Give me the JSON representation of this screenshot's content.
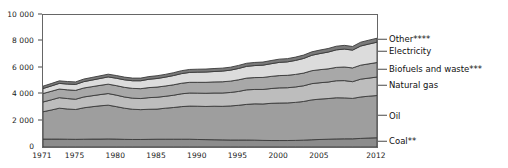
{
  "chart_data": {
    "type": "area",
    "title": "",
    "subtitle": "",
    "xlabel": "",
    "ylabel": "",
    "stacked": true,
    "grid": false,
    "legend_position": "right-inline-labels",
    "xlim": [
      1971,
      2012
    ],
    "ylim": [
      0,
      10000
    ],
    "y_ticks": [
      "0",
      "2 000",
      "4 000",
      "6 000",
      "8 000",
      "10 000"
    ],
    "y_tick_values": [
      0,
      2000,
      4000,
      6000,
      8000,
      10000
    ],
    "x_ticks": [
      "1971",
      "1975",
      "1980",
      "1985",
      "1990",
      "1995",
      "2000",
      "2005",
      "2012"
    ],
    "x_tick_values": [
      1971,
      1975,
      1980,
      1985,
      1990,
      1995,
      2000,
      2005,
      2012
    ],
    "x": [
      1971,
      1972,
      1973,
      1974,
      1975,
      1976,
      1977,
      1978,
      1979,
      1980,
      1981,
      1982,
      1983,
      1984,
      1985,
      1986,
      1987,
      1988,
      1989,
      1990,
      1991,
      1992,
      1993,
      1994,
      1995,
      1996,
      1997,
      1998,
      1999,
      2000,
      2001,
      2002,
      2003,
      2004,
      2005,
      2006,
      2007,
      2008,
      2009,
      2010,
      2011,
      2012
    ],
    "series": [
      {
        "name": "Coal**",
        "color": "#8c8c8c",
        "values": [
          600,
          600,
          600,
          590,
          580,
          590,
          600,
          600,
          610,
          600,
          580,
          570,
          570,
          580,
          590,
          590,
          590,
          590,
          590,
          570,
          560,
          550,
          540,
          530,
          530,
          530,
          520,
          500,
          490,
          490,
          490,
          500,
          520,
          550,
          570,
          590,
          610,
          620,
          620,
          650,
          680,
          700
        ]
      },
      {
        "name": "Oil",
        "color": "#9e9e9e",
        "values": [
          2070,
          2200,
          2340,
          2290,
          2260,
          2380,
          2450,
          2520,
          2560,
          2460,
          2360,
          2290,
          2260,
          2280,
          2280,
          2350,
          2400,
          2470,
          2510,
          2520,
          2510,
          2540,
          2540,
          2580,
          2630,
          2700,
          2750,
          2760,
          2820,
          2840,
          2850,
          2880,
          2930,
          3020,
          3060,
          3080,
          3120,
          3100,
          3060,
          3140,
          3170,
          3200
        ]
      },
      {
        "name": "Natural gas",
        "color": "#bdbdbd",
        "values": [
          740,
          770,
          800,
          790,
          780,
          820,
          830,
          850,
          880,
          870,
          850,
          840,
          840,
          880,
          900,
          900,
          930,
          970,
          990,
          990,
          1000,
          1000,
          1010,
          1020,
          1050,
          1100,
          1090,
          1100,
          1120,
          1150,
          1150,
          1170,
          1190,
          1230,
          1240,
          1250,
          1290,
          1310,
          1270,
          1350,
          1370,
          1400
        ]
      },
      {
        "name": "Biofuels and waste***",
        "color": "#a8a8a8",
        "values": [
          640,
          650,
          650,
          660,
          670,
          680,
          690,
          700,
          710,
          720,
          730,
          740,
          750,
          760,
          770,
          780,
          790,
          800,
          810,
          820,
          830,
          840,
          850,
          860,
          880,
          890,
          900,
          910,
          920,
          930,
          940,
          950,
          960,
          980,
          990,
          1000,
          1010,
          1030,
          1040,
          1060,
          1080,
          1100
        ]
      },
      {
        "name": "Electricity",
        "color": "#dcdcdc",
        "values": [
          380,
          400,
          430,
          440,
          450,
          480,
          500,
          520,
          550,
          560,
          570,
          580,
          600,
          630,
          650,
          670,
          700,
          730,
          750,
          770,
          780,
          790,
          810,
          830,
          860,
          890,
          910,
          930,
          960,
          1000,
          1020,
          1060,
          1110,
          1170,
          1220,
          1270,
          1330,
          1360,
          1350,
          1450,
          1500,
          1540
        ]
      },
      {
        "name": "Other****",
        "color": "#7a7a7a",
        "values": [
          180,
          185,
          190,
          190,
          190,
          195,
          200,
          200,
          205,
          205,
          205,
          200,
          200,
          205,
          210,
          210,
          215,
          220,
          225,
          225,
          225,
          225,
          225,
          225,
          230,
          235,
          235,
          235,
          240,
          245,
          245,
          250,
          255,
          260,
          265,
          270,
          275,
          280,
          275,
          290,
          295,
          300
        ]
      }
    ],
    "totals": [
      4610,
      4805,
      5010,
      4960,
      4930,
      5145,
      5270,
      5390,
      5515,
      5415,
      5295,
      5220,
      5220,
      5335,
      5400,
      5500,
      5625,
      5780,
      5875,
      5895,
      5905,
      5945,
      5975,
      6045,
      6180,
      6345,
      6405,
      6435,
      6550,
      6655,
      6695,
      6810,
      6965,
      7210,
      7345,
      7460,
      7635,
      7700,
      7615,
      7940,
      8095,
      8240
    ]
  },
  "legend": {
    "items": [
      {
        "label": "Other****"
      },
      {
        "label": "Electricity"
      },
      {
        "label": "Biofuels and waste***"
      },
      {
        "label": "Natural gas"
      },
      {
        "label": "Oil"
      },
      {
        "label": "Coal**"
      }
    ]
  }
}
